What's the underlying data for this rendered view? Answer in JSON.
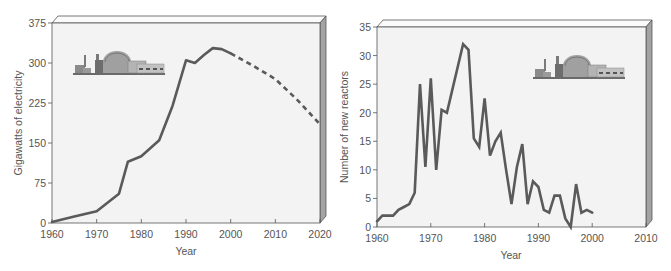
{
  "colors": {
    "line": "#5a5a5a",
    "plot_bg": "#f4f4f4",
    "top_face": "#fafafa",
    "side_face": "#9a9a9a",
    "axis": "#555555",
    "text": "#555555"
  },
  "chart_data": [
    {
      "type": "line",
      "title": "",
      "xlabel": "Year",
      "ylabel": "Gigawatts of electricity",
      "xlim": [
        1960,
        2020
      ],
      "ylim": [
        0,
        375
      ],
      "xticks": [
        "1960",
        "1970",
        "1980",
        "1990",
        "2000",
        "2010",
        "2020"
      ],
      "yticks": [
        "0",
        "75",
        "150",
        "225",
        "300",
        "375"
      ],
      "grid": false,
      "legend": null,
      "series": [
        {
          "name": "Actual",
          "style": "solid",
          "x": [
            1960,
            1965,
            1970,
            1972,
            1975,
            1977,
            1980,
            1984,
            1987,
            1990,
            1992,
            1994,
            1996,
            1998,
            2000
          ],
          "values": [
            2,
            12,
            22,
            35,
            55,
            115,
            125,
            155,
            220,
            305,
            300,
            315,
            328,
            326,
            318
          ]
        },
        {
          "name": "Projected",
          "style": "dashed",
          "x": [
            2000,
            2005,
            2010,
            2015,
            2020
          ],
          "values": [
            318,
            295,
            270,
            230,
            185
          ]
        }
      ],
      "annotations": [
        "nuclear power plant illustration"
      ]
    },
    {
      "type": "line",
      "title": "",
      "xlabel": "Year",
      "ylabel": "Number of new reactors",
      "xlim": [
        1960,
        2010
      ],
      "ylim": [
        0,
        35
      ],
      "xticks": [
        "1960",
        "1970",
        "1980",
        "1990",
        "2000",
        "2010"
      ],
      "yticks": [
        "0",
        "5",
        "10",
        "15",
        "20",
        "25",
        "30",
        "35"
      ],
      "grid": false,
      "legend": null,
      "series": [
        {
          "name": "New reactors",
          "style": "solid",
          "x": [
            1960,
            1961,
            1962,
            1963,
            1964,
            1965,
            1966,
            1967,
            1968,
            1969,
            1970,
            1971,
            1972,
            1973,
            1974,
            1975,
            1976,
            1977,
            1978,
            1979,
            1980,
            1981,
            1982,
            1983,
            1984,
            1985,
            1986,
            1987,
            1988,
            1989,
            1990,
            1991,
            1992,
            1993,
            1994,
            1995,
            1996,
            1997,
            1998,
            1999,
            2000
          ],
          "values": [
            1,
            2,
            2,
            2,
            3,
            3.5,
            4,
            6,
            25,
            10.5,
            26,
            10,
            20.5,
            20,
            24,
            28,
            32,
            31,
            15.5,
            14,
            22.5,
            12.5,
            15,
            16.5,
            10,
            4,
            10.5,
            14.5,
            4,
            8,
            7,
            3,
            2.5,
            5.5,
            5.5,
            1.5,
            0,
            7.5,
            2.5,
            3,
            2.5
          ]
        }
      ],
      "annotations": [
        "nuclear power plant illustration"
      ]
    }
  ]
}
